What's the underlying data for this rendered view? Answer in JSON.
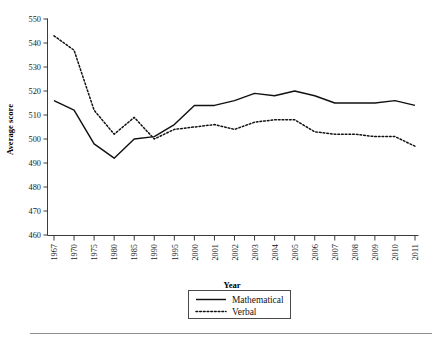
{
  "chart_data": {
    "type": "line",
    "title": "",
    "xlabel": "Year",
    "ylabel": "Average score",
    "ylim": [
      460,
      550
    ],
    "ytick_step": 10,
    "grid": false,
    "legend_position": "bottom-center",
    "categories": [
      "1967",
      "1970",
      "1975",
      "1980",
      "1985",
      "1990",
      "1995",
      "2000",
      "2001",
      "2002",
      "2003",
      "2004",
      "2005",
      "2006",
      "2007",
      "2008",
      "2009",
      "2010",
      "2011"
    ],
    "yticks": [
      "460",
      "470",
      "480",
      "490",
      "500",
      "510",
      "520",
      "530",
      "540",
      "550"
    ],
    "series": [
      {
        "name": "Mathematical",
        "style": "solid",
        "color": "#111111",
        "values": [
          516,
          512,
          498,
          492,
          500,
          501,
          506,
          514,
          514,
          516,
          519,
          518,
          520,
          518,
          515,
          515,
          515,
          516,
          514
        ]
      },
      {
        "name": "Verbal",
        "style": "dotted",
        "color": "#111111",
        "values": [
          543,
          537,
          512,
          502,
          509,
          500,
          504,
          505,
          506,
          504,
          507,
          508,
          508,
          503,
          502,
          502,
          501,
          501,
          497
        ]
      }
    ]
  },
  "axes": {
    "y_axis_title": "Average score",
    "x_axis_title": "Year"
  },
  "legend": {
    "items": [
      {
        "label": "Mathematical",
        "style": "solid"
      },
      {
        "label": "Verbal",
        "style": "dotted"
      }
    ]
  }
}
